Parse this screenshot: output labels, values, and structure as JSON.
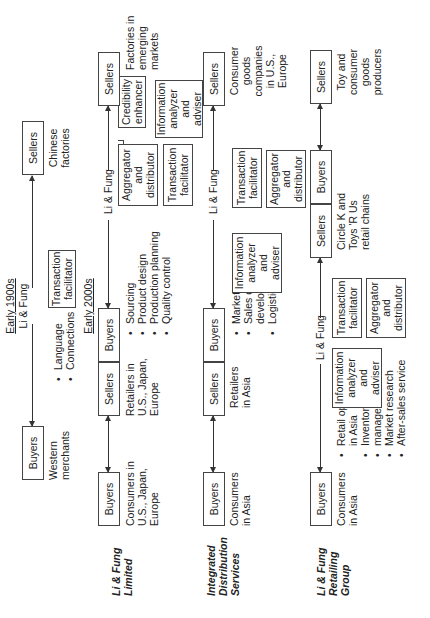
{
  "row1": {
    "era_top": "Early 1900s",
    "intermediary": "Li & Fung",
    "buyers": {
      "label": "Buyers",
      "desc": [
        "Western",
        "merchants"
      ]
    },
    "sellers": {
      "label": "Sellers",
      "desc": [
        "Chinese",
        "factories"
      ]
    },
    "roles": [
      "Transaction",
      "facilitator"
    ],
    "bullets": [
      "Language",
      "Connections"
    ],
    "era_bottom": "Early 2000s"
  },
  "row2": {
    "label": [
      "Li & Fung",
      "Limited"
    ],
    "intermediary": "Li & Fung",
    "buyers": {
      "label": "Buyers",
      "desc": [
        "Consumers in",
        "U.S., Japan,",
        "Europe"
      ]
    },
    "middle": {
      "sellers": "Sellers",
      "buyers": "Buyers",
      "desc": [
        "Retailers in",
        "U.S., Japan,",
        "Europe"
      ]
    },
    "bullets": [
      "Sourcing",
      "Product design",
      "Production planning",
      "Quality control"
    ],
    "roles": {
      "aggregator": [
        "Aggregator",
        "and",
        "distributor"
      ],
      "transaction": [
        "Transaction",
        "facilitator"
      ],
      "credibility": [
        "Credibility",
        "enhancer"
      ],
      "information": [
        "Information",
        "analyzer",
        "and",
        "adviser"
      ]
    },
    "sellers": {
      "label": "Sellers",
      "desc": [
        "Factories in",
        "emerging",
        "markets"
      ]
    }
  },
  "row3": {
    "label": [
      "Integrated",
      "Distribution",
      "Services"
    ],
    "intermediary": "Li & Fung",
    "buyers": {
      "label": "Buyers",
      "desc": [
        "Consumers",
        "in Asia"
      ]
    },
    "middle": {
      "sellers": "Sellers",
      "buyers": "Buyers",
      "desc": [
        "Retailers",
        "in Asia"
      ]
    },
    "bullets": [
      "Marketing",
      "Sales channel",
      "development",
      "Logistics"
    ],
    "roles": {
      "information": [
        "Information",
        "analyzer",
        "and",
        "adviser"
      ],
      "transaction": [
        "Transaction",
        "facilitator"
      ],
      "aggregator": [
        "Aggregator",
        "and",
        "distributor"
      ]
    },
    "sellers": {
      "label": "Sellers",
      "desc": [
        "Consumer",
        "goods",
        "companies",
        "in U.S.,",
        "Europe"
      ]
    }
  },
  "row4": {
    "label": [
      "Li & Fung",
      "Retailing",
      "Group"
    ],
    "intermediary": "Li & Fung",
    "buyers": {
      "label": "Buyers",
      "desc": [
        "Consumers",
        "in Asia"
      ]
    },
    "bullets": [
      "Retail operations",
      "in Asia",
      "Inventory",
      "management",
      "Market research",
      "After-sales service"
    ],
    "roles": {
      "information": [
        "Information",
        "analyzer",
        "and",
        "adviser"
      ],
      "transaction": [
        "Transaction",
        "facilitator"
      ],
      "aggregator": [
        "Aggregator",
        "and",
        "distributor"
      ]
    },
    "middle": {
      "sellers": "Sellers",
      "buyers": "Buyers",
      "desc": [
        "Circle K and",
        "Toys 'R Us",
        "retail chains"
      ]
    },
    "sellers": {
      "label": "Sellers",
      "desc": [
        "Toy and",
        "consumer",
        "goods",
        "producers"
      ]
    }
  }
}
